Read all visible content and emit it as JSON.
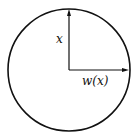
{
  "diagram": {
    "shape": "circle",
    "center": [
      69,
      70
    ],
    "radius": 61,
    "stroke_color": "#111111",
    "arrows": [
      {
        "name": "vertical-arrow",
        "from": [
          69,
          70
        ],
        "to": [
          69,
          9
        ],
        "label": "x"
      },
      {
        "name": "horizontal-arrow",
        "from": [
          69,
          70
        ],
        "to": [
          129,
          70
        ],
        "label": "w(x)"
      }
    ],
    "labels": {
      "vertical": "x",
      "horizontal": "w(x)"
    }
  }
}
